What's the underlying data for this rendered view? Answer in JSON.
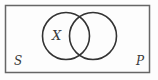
{
  "diagram": {
    "type": "venn-diagram",
    "labels": {
      "left_circle": "X",
      "universe_left": "S",
      "universe_right": "P"
    },
    "colors": {
      "circle_stroke": "#333333",
      "box_stroke": "#666666",
      "label_color": "#3a3a3a",
      "background": "#fdfdfd"
    }
  }
}
